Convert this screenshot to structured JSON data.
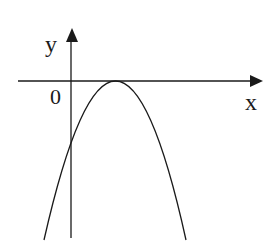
{
  "diagram": {
    "type": "parabola-graph",
    "axes": {
      "x_label": "x",
      "y_label": "y",
      "origin_label": "0"
    },
    "curve": {
      "kind": "parabola",
      "opens": "down",
      "vertex_position": "on positive x-axis (touches x-axis)",
      "y_intercept": "negative"
    },
    "colors": {
      "stroke": "#1a1a1a",
      "background": "#ffffff"
    }
  }
}
